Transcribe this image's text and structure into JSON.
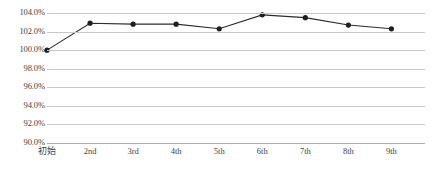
{
  "chart_data": {
    "type": "line",
    "title": "",
    "subtitle": "",
    "xlabel": "",
    "ylabel": "",
    "categories": [
      "初始",
      "2nd",
      "3rd",
      "4th",
      "5th",
      "6th",
      "7th",
      "8th",
      "9th"
    ],
    "values": [
      100.0,
      102.9,
      102.8,
      102.8,
      102.3,
      103.8,
      103.5,
      102.7,
      102.3
    ],
    "value_suffix": "%",
    "ylim": [
      90.0,
      104.0
    ],
    "ytick_step": 2.0,
    "ytick_labels": [
      "104.0%",
      "102.0%",
      "100.0%",
      "98.0%",
      "96.0%",
      "94.0%",
      "92.0%",
      "90.0%"
    ],
    "ytick_values": [
      104.0,
      102.0,
      100.0,
      98.0,
      96.0,
      94.0,
      92.0,
      90.0
    ],
    "grid": true,
    "grid_axis": "y",
    "legend": false,
    "legend_position": "none",
    "series": [
      {
        "name": "series-1",
        "values": [
          100.0,
          102.9,
          102.8,
          102.8,
          102.3,
          103.8,
          103.5,
          102.7,
          102.3
        ],
        "line_color": "#2b2b2b",
        "marker_color": "#1f1f1f",
        "marker": "circle"
      }
    ],
    "colors": {
      "line": "#2b2b2b",
      "marker": "#1f1f1f",
      "gridline": "#c8c8c8",
      "axis": "#b0b0b0",
      "text": "#3f3f3f",
      "background": "#ffffff"
    }
  }
}
